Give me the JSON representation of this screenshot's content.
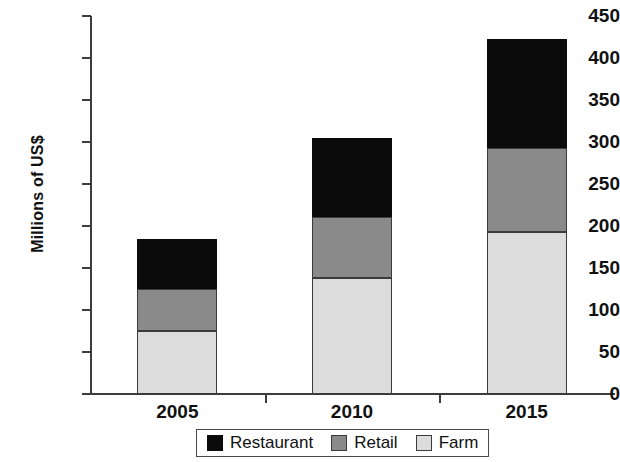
{
  "chart_data": {
    "type": "bar",
    "subtype": "stacked-bar",
    "title": "",
    "xlabel": "",
    "ylabel": "Millions of US$",
    "categories": [
      "2005",
      "2010",
      "2015"
    ],
    "series": [
      {
        "name": "Farm",
        "values": [
          75,
          138,
          193
        ],
        "color": "#dcdcdc"
      },
      {
        "name": "Retail",
        "values": [
          50,
          73,
          100
        ],
        "color": "#8a8a8a"
      },
      {
        "name": "Restaurant",
        "values": [
          59,
          94,
          130
        ],
        "color": "#0b0b0b"
      }
    ],
    "stack_order": [
      "Farm",
      "Retail",
      "Restaurant"
    ],
    "totals": [
      185,
      305,
      423
    ],
    "ylim": [
      0,
      450
    ],
    "ytick_values": [
      0,
      50,
      100,
      150,
      200,
      250,
      300,
      350,
      400,
      450
    ],
    "ytick_labels": [
      "0",
      "50",
      "100",
      "150",
      "200",
      "250",
      "300",
      "350",
      "400",
      "450"
    ],
    "grid": false,
    "legend_position": "bottom"
  },
  "axis": {
    "y_label": "Millions of US$",
    "y_ticks": [
      {
        "value": 450,
        "label": "450"
      },
      {
        "value": 400,
        "label": "400"
      },
      {
        "value": 350,
        "label": "350"
      },
      {
        "value": 300,
        "label": "300"
      },
      {
        "value": 250,
        "label": "250"
      },
      {
        "value": 200,
        "label": "200"
      },
      {
        "value": 150,
        "label": "150"
      },
      {
        "value": 100,
        "label": "100"
      },
      {
        "value": 50,
        "label": "50"
      },
      {
        "value": 0,
        "label": "0"
      }
    ],
    "x_labels": [
      "2005",
      "2010",
      "2015"
    ]
  },
  "legend": {
    "items": [
      {
        "label": "Restaurant",
        "color": "#0b0b0b",
        "key": "restaurant"
      },
      {
        "label": "Retail",
        "color": "#8a8a8a",
        "key": "retail"
      },
      {
        "label": "Farm",
        "color": "#dcdcdc",
        "key": "farm"
      }
    ]
  },
  "colors": {
    "restaurant": "#0b0b0b",
    "retail": "#8a8a8a",
    "farm": "#dcdcdc",
    "axis": "#3d3d3d",
    "text": "#111111",
    "background": "#ffffff"
  }
}
